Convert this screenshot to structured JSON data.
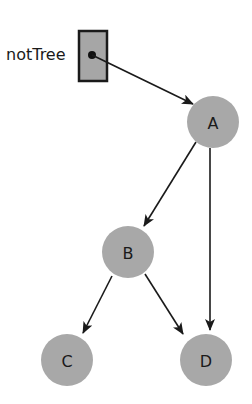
{
  "diagram": {
    "pointer": {
      "label": "notTree"
    },
    "nodes": [
      {
        "id": "A",
        "label": "A"
      },
      {
        "id": "B",
        "label": "B"
      },
      {
        "id": "C",
        "label": "C"
      },
      {
        "id": "D",
        "label": "D"
      }
    ],
    "edges": [
      {
        "from": "notTree",
        "to": "A"
      },
      {
        "from": "A",
        "to": "B"
      },
      {
        "from": "A",
        "to": "D"
      },
      {
        "from": "B",
        "to": "C"
      },
      {
        "from": "B",
        "to": "D"
      }
    ],
    "colors": {
      "node_fill": "#a8a8a8",
      "box_fill": "#a6a6a6",
      "stroke": "#1a1a1a"
    }
  }
}
